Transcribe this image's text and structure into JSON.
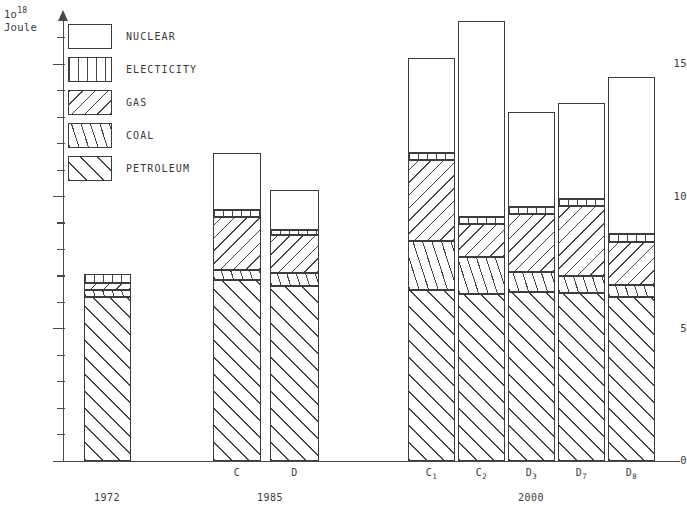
{
  "axis": {
    "unit_prefix": "1o",
    "unit_exponent": "18",
    "unit_name": "Joule",
    "y_major_labels": [
      "15",
      "10",
      "5",
      "0"
    ],
    "y_major_values": [
      15,
      10,
      5,
      0
    ]
  },
  "legend": {
    "items": [
      {
        "key": "nuclear",
        "label": "NUCLEAR",
        "pattern": "blank"
      },
      {
        "key": "electicity",
        "label": "ELECTICITY",
        "pattern": "vertical-lines"
      },
      {
        "key": "gas",
        "label": "GAS",
        "pattern": "backslash-hatch"
      },
      {
        "key": "coal",
        "label": "COAL",
        "pattern": "steep-slash-hatch"
      },
      {
        "key": "petroleum",
        "label": "PETROLEUM",
        "pattern": "slash-hatch"
      }
    ]
  },
  "groups": [
    {
      "key": "g1972",
      "label": "1972",
      "bars": [
        "b1972"
      ]
    },
    {
      "key": "g1985",
      "label": "1985",
      "bars": [
        "C",
        "D"
      ]
    },
    {
      "key": "g2000",
      "label": "2000",
      "bars": [
        "C1",
        "C2",
        "D3",
        "D7",
        "D8"
      ]
    }
  ],
  "chart_data": {
    "type": "bar",
    "title": "",
    "subtype": "stacked",
    "xlabel": "",
    "ylabel": "1o^18 Joule",
    "ylim": [
      0,
      17
    ],
    "grid": false,
    "legend_position": "inside-top-left",
    "tick_interval_major": 5,
    "tick_interval_minor": 1,
    "group_labels": [
      "1972",
      "1985",
      "2000"
    ],
    "categories": [
      "",
      "C",
      "D",
      "C1",
      "C2",
      "D3",
      "D7",
      "D8"
    ],
    "category_display": [
      "",
      "C",
      "D",
      "C₁",
      "C₂",
      "D₃",
      "D₇",
      "D₈"
    ],
    "series": [
      {
        "name": "PETROLEUM",
        "values": [
          6.2,
          6.85,
          6.6,
          6.45,
          6.3,
          6.4,
          6.35,
          6.2
        ]
      },
      {
        "name": "COAL",
        "values": [
          0.27,
          0.38,
          0.49,
          1.88,
          1.43,
          0.75,
          0.64,
          0.45
        ]
      },
      {
        "name": "GAS",
        "values": [
          0.27,
          2.0,
          1.47,
          3.05,
          1.24,
          2.19,
          2.64,
          1.62
        ]
      },
      {
        "name": "ELECTICITY",
        "values": [
          0.34,
          0.26,
          0.19,
          0.26,
          0.26,
          0.26,
          0.26,
          0.3
        ]
      },
      {
        "name": "NUCLEAR",
        "values": [
          0.0,
          2.15,
          1.5,
          3.58,
          7.4,
          3.58,
          3.63,
          5.93
        ]
      }
    ],
    "totals": [
      7.05,
      11.2,
      10.2,
      15.2,
      16.6,
      13.2,
      13.5,
      14.5
    ]
  }
}
